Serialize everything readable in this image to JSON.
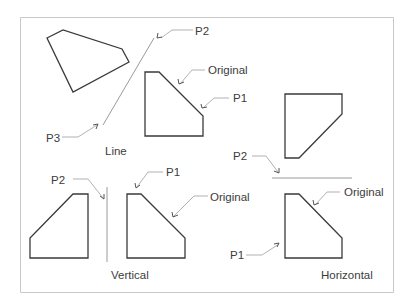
{
  "diagram": {
    "colors": {
      "shape": "#3a3a3a",
      "mirror_line": "#9a9a9a",
      "frame": "#c8c8c8"
    },
    "panels": [
      {
        "id": "line",
        "caption": "Line",
        "labels": {
          "p2": "P2",
          "p3": "P3",
          "original": "Original",
          "p1": "P1"
        }
      },
      {
        "id": "vertical",
        "caption": "Vertical",
        "labels": {
          "p2": "P2",
          "p1": "P1",
          "original": "Original"
        }
      },
      {
        "id": "horizontal",
        "caption": "Horizontal",
        "labels": {
          "p2": "P2",
          "original": "Original",
          "p1": "P1"
        }
      }
    ]
  }
}
